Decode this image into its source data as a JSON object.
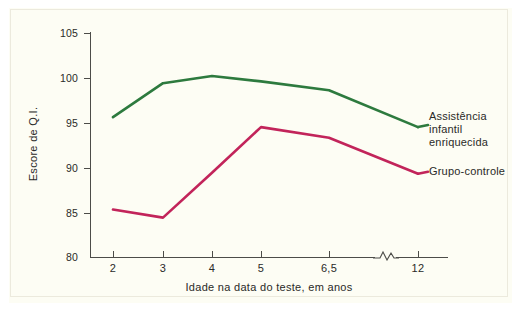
{
  "chart_data": {
    "type": "line",
    "title": "",
    "xlabel": "Idade na data do teste, em anos",
    "ylabel": "Escore de Q.I.",
    "x": [
      "2",
      "3",
      "4",
      "5",
      "6,5",
      "12"
    ],
    "xticklabels": [
      "2",
      "3",
      "4",
      "5",
      "6,5",
      "12"
    ],
    "yticklabels": [
      "80",
      "85",
      "90",
      "95",
      "100",
      "105"
    ],
    "ylim": [
      80,
      105
    ],
    "grid": false,
    "axis_break_between": [
      "6,5",
      "12"
    ],
    "legend_position": "right-inline-labels",
    "series": [
      {
        "name": "Assistência\ninfantil\nenriquecida",
        "name_flat": "Assistência infantil enriquecida",
        "color": "#2d7a3e",
        "values": [
          95.6,
          99.4,
          100.2,
          99.6,
          98.6,
          94.5
        ]
      },
      {
        "name": "Grupo-controle",
        "name_flat": "Grupo-controle",
        "color": "#c2245a",
        "values": [
          85.3,
          84.4,
          89.4,
          94.5,
          93.3,
          89.3
        ]
      }
    ]
  },
  "axes": {
    "y_ticks": [
      "105",
      "100",
      "95",
      "90",
      "85",
      "80"
    ],
    "x_ticks": [
      "2",
      "3",
      "4",
      "5",
      "6,5",
      "12"
    ],
    "y_title": "Escore de Q.I.",
    "x_title": "Idade na data do teste, em anos"
  },
  "labels": {
    "enriched": "Assistência\ninfantil\nenriquecida",
    "control": "Grupo-controle"
  },
  "colors": {
    "enriched": "#2d7a3e",
    "control": "#c2245a",
    "axis": "#4c4c48",
    "background": "#fdfdf4",
    "text": "#2a2a28"
  }
}
